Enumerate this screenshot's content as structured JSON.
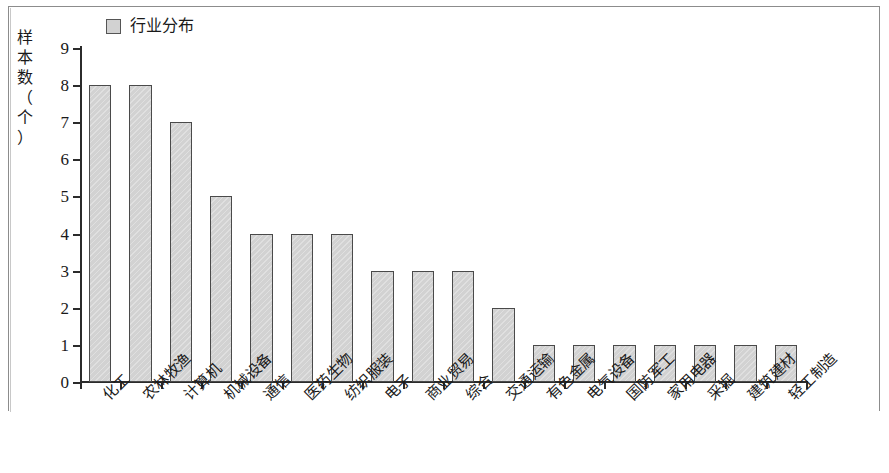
{
  "legend": {
    "label": "行业分布",
    "swatch_color": "#d2d2d2",
    "swatch_border": "#555555"
  },
  "y_axis": {
    "title_chars": [
      "样",
      "本",
      "数",
      "（",
      "个",
      "）"
    ],
    "title": "样本数（个）",
    "ticks": [
      0,
      1,
      2,
      3,
      4,
      5,
      6,
      7,
      8,
      9
    ]
  },
  "chart_data": {
    "type": "bar",
    "title": "",
    "xlabel": "",
    "ylabel": "样本数（个）",
    "ylim": [
      0,
      9
    ],
    "grid": false,
    "legend_position": "top-left",
    "legend_entries": [
      "行业分布"
    ],
    "categories": [
      "化工",
      "农林牧渔",
      "计算机",
      "机械设备",
      "通信",
      "医药生物",
      "纺织服装",
      "电子",
      "商业贸易",
      "综合",
      "交通运输",
      "有色金属",
      "电气设备",
      "国防军工",
      "家用电器",
      "采掘",
      "建筑建材",
      "轻工制造"
    ],
    "values": [
      8,
      8,
      7,
      5,
      4,
      4,
      4,
      3,
      3,
      3,
      2,
      1,
      1,
      1,
      1,
      1,
      1,
      1
    ],
    "series": [
      {
        "name": "行业分布",
        "values": [
          8,
          8,
          7,
          5,
          4,
          4,
          4,
          3,
          3,
          3,
          2,
          1,
          1,
          1,
          1,
          1,
          1,
          1
        ]
      }
    ],
    "bar_color": "#d2d2d2",
    "bar_border_color": "#4a4a4a",
    "axis_color": "#2b2b2b"
  }
}
